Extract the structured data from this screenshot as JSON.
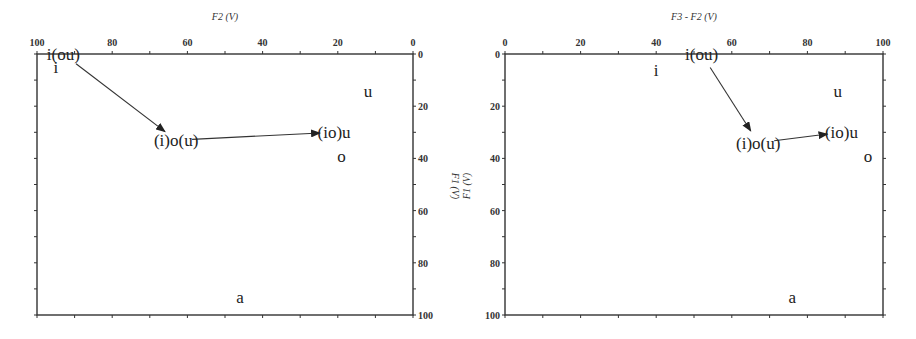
{
  "chart_data": [
    {
      "type": "scatter",
      "title": "",
      "xlabel": "F2 (V)",
      "ylabel": "F1 (V)",
      "xlim": [
        100,
        0
      ],
      "ylim": [
        100,
        0
      ],
      "x_reversed": true,
      "y_reversed": true,
      "x_axis_position": "top",
      "y_axis_position": "right",
      "x_ticks": [
        "100",
        "80",
        "60",
        "40",
        "20",
        "0"
      ],
      "y_ticks": [
        "0",
        "20",
        "40",
        "60",
        "80",
        "100"
      ],
      "grid": false,
      "labels": [
        {
          "text": "i",
          "x": 95,
          "y": 5
        },
        {
          "text": "u",
          "x": 12,
          "y": 14
        },
        {
          "text": "o",
          "x": 19,
          "y": 39
        },
        {
          "text": "a",
          "x": 46,
          "y": 93
        }
      ],
      "trajectory": {
        "points": [
          {
            "label": "i(ou)",
            "x": 93,
            "y": 0
          },
          {
            "label": "(i)o(u)",
            "x": 63,
            "y": 33
          },
          {
            "label": "(io)u",
            "x": 21,
            "y": 30
          }
        ],
        "arrows": true
      }
    },
    {
      "type": "scatter",
      "title": "",
      "xlabel": "F3 - F2 (V)",
      "ylabel": "F1 (V)",
      "xlim": [
        0,
        100
      ],
      "ylim": [
        100,
        0
      ],
      "y_reversed": true,
      "x_axis_position": "top",
      "y_axis_position": "left",
      "x_ticks": [
        "0",
        "20",
        "40",
        "60",
        "80",
        "100"
      ],
      "y_ticks": [
        "0",
        "20",
        "40",
        "60",
        "80",
        "100"
      ],
      "grid": false,
      "labels": [
        {
          "text": "i",
          "x": 40,
          "y": 6
        },
        {
          "text": "u",
          "x": 88,
          "y": 14
        },
        {
          "text": "o",
          "x": 96,
          "y": 39
        },
        {
          "text": "a",
          "x": 76,
          "y": 93
        }
      ],
      "trajectory": {
        "points": [
          {
            "label": "i(ou)",
            "x": 52,
            "y": 0
          },
          {
            "label": "(i)o(u)",
            "x": 67,
            "y": 34
          },
          {
            "label": "(io)u",
            "x": 89,
            "y": 30
          }
        ],
        "arrows": true
      }
    }
  ]
}
